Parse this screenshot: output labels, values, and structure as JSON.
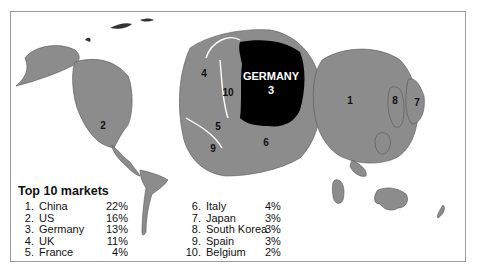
{
  "figure": {
    "header_text_cropped": "",
    "labels": {
      "china": "1",
      "us": "2",
      "germany_name": "GERMANY",
      "germany_rank": "3",
      "uk": "4",
      "france": "5",
      "italy": "6",
      "japan": "7",
      "south_korea": "8",
      "spain": "9",
      "belgium": "10"
    },
    "colors": {
      "land": "#8c8c8c",
      "highlight": "#000000",
      "frame": "#9a9a9a",
      "background": "#ffffff"
    }
  },
  "legend": {
    "title": "Top 10 markets",
    "left": [
      {
        "rank": "1.",
        "name": "China",
        "pct": "22%"
      },
      {
        "rank": "2.",
        "name": "US",
        "pct": "16%"
      },
      {
        "rank": "3.",
        "name": "Germany",
        "pct": "13%"
      },
      {
        "rank": "4.",
        "name": "UK",
        "pct": "11%"
      },
      {
        "rank": "5.",
        "name": "France",
        "pct": "4%"
      }
    ],
    "right": [
      {
        "rank": "6.",
        "name": "Italy",
        "pct": "4%"
      },
      {
        "rank": "7.",
        "name": "Japan",
        "pct": "3%"
      },
      {
        "rank": "8.",
        "name": "South Korea",
        "pct": "3%"
      },
      {
        "rank": "9.",
        "name": "Spain",
        "pct": "3%"
      },
      {
        "rank": "10.",
        "name": "Belgium",
        "pct": "2%"
      }
    ]
  }
}
